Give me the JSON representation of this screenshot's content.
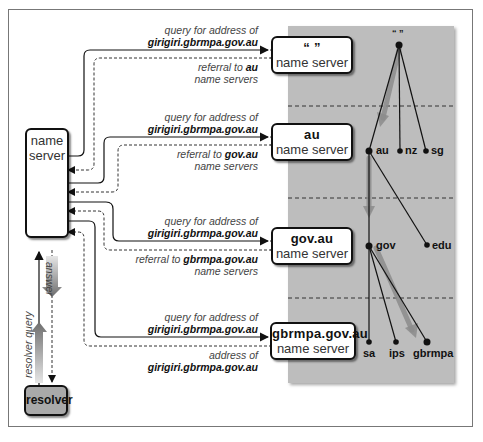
{
  "diagram": {
    "local_server": {
      "line1": "name",
      "line2": "server"
    },
    "resolver": {
      "label": "resolver"
    },
    "vertical_labels": {
      "answer": "answer",
      "resolver_query": "resolver query"
    },
    "servers": [
      {
        "title": "“ ”",
        "subtitle": "name server"
      },
      {
        "title": "au",
        "subtitle": "name server"
      },
      {
        "title": "gov.au",
        "subtitle": "name server"
      },
      {
        "title": "gbrmpa.gov.au",
        "subtitle": "name server"
      }
    ],
    "exchanges": [
      {
        "query_line1": "query for address of",
        "query_line2": "girigiri.gbrmpa.gov.au",
        "reply_prefix": "referral to ",
        "reply_bold": "au",
        "reply_line2": "name servers"
      },
      {
        "query_line1": "query for address of",
        "query_line2": "girigiri.gbrmpa.gov.au",
        "reply_prefix": "referral to ",
        "reply_bold": "gov.au",
        "reply_line2": "name servers"
      },
      {
        "query_line1": "query for address of",
        "query_line2": "girigiri.gbrmpa.gov.au",
        "reply_prefix": "referral to ",
        "reply_bold": "gbrmpa.gov.au",
        "reply_line2": "name servers"
      },
      {
        "query_line1": "query for address of",
        "query_line2": "girigiri.gbrmpa.gov.au",
        "reply_prefix": "",
        "reply_bold": "",
        "reply_line1_plain": "address of",
        "reply_line2_bold": "girigiri.gbrmpa.gov.au"
      }
    ],
    "tree": {
      "root": "“ ”",
      "level1": [
        "au",
        "nz",
        "sg"
      ],
      "level2": [
        "gov",
        "edu"
      ],
      "level3": [
        "sa",
        "ips",
        "gbrmpa"
      ]
    },
    "colors": {
      "panel": "#bdbdbd",
      "resolver": "#a9a9a9",
      "arrow_gradient_dark": "#6e6e6e",
      "arrow_gradient_light": "#e0e0e0"
    }
  }
}
